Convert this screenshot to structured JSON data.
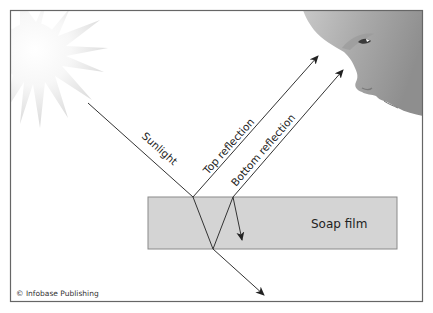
{
  "diagram": {
    "labels": {
      "sunlight": "Sunlight",
      "top_reflection": "Top reflection",
      "bottom_reflection": "Bottom reflection",
      "soap_film": "Soap film"
    },
    "credit": "© Infobase Publishing",
    "icons": {
      "sun": "sun-icon",
      "face": "observer-face-icon"
    },
    "colors": {
      "frame": "#666666",
      "film_fill": "#d4d4d4",
      "film_stroke": "#8a8a8a",
      "ray": "#333333",
      "text": "#222222"
    }
  }
}
